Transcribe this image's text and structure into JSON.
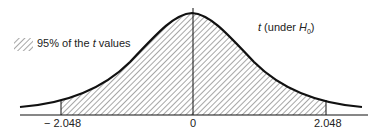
{
  "legend": {
    "text_prefix": "95% of the ",
    "text_var": "t",
    "text_suffix": " values"
  },
  "curve_label": {
    "var": "t",
    "text": " (under ",
    "h": "H",
    "sub": "0",
    "close": ")"
  },
  "axis": {
    "ticks": [
      "− 2.048",
      "0",
      "2.048"
    ]
  },
  "colors": {
    "ink": "#111111",
    "bg": "#ffffff"
  }
}
